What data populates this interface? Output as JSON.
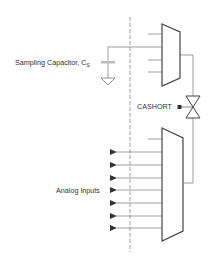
{
  "diagram": {
    "type": "analog multiplexer with sampling capacitor",
    "labels": {
      "sampling_capacitor": "Sampling Capacitor, C",
      "sampling_capacitor_subscript": "S",
      "cashort": "CASHORT",
      "analog_inputs": "Analog Inputs"
    },
    "colors": {
      "line": "#555555",
      "mux": "#444444",
      "capacitor": "#bbbbbb",
      "text": "#333333",
      "background": "#ffffff"
    },
    "analog_input_count": 7
  }
}
